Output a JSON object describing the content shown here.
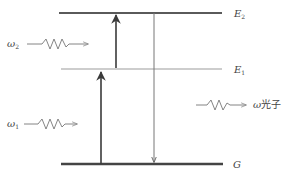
{
  "diagram": {
    "levels": [
      {
        "id": "E2",
        "symbol": "E",
        "subscript": "2",
        "y": 13,
        "x1": 59,
        "x2": 222,
        "color": "#5a5a5a",
        "width": 2
      },
      {
        "id": "E1",
        "symbol": "E",
        "subscript": "1",
        "y": 69,
        "x1": 61,
        "x2": 222,
        "color": "#bcbcbc",
        "width": 1.6
      },
      {
        "id": "G",
        "symbol": "G",
        "subscript": "",
        "y": 164,
        "x1": 61,
        "x2": 223,
        "color": "#444444",
        "width": 2.4
      }
    ],
    "transitions": [
      {
        "from": "G",
        "to": "E1",
        "direction": "up",
        "x": 101
      },
      {
        "from": "E1",
        "to": "E2",
        "direction": "up",
        "x": 116
      },
      {
        "from": "E2",
        "to": "G",
        "direction": "down",
        "x": 154
      }
    ],
    "photons": [
      {
        "id": "omega2",
        "symbol": "ω",
        "subscript": "2",
        "role": "incident"
      },
      {
        "id": "omega1",
        "symbol": "ω",
        "subscript": "1",
        "role": "incident"
      },
      {
        "id": "omega-emitted",
        "symbol": "ω",
        "suffix": "光子",
        "role": "emitted"
      }
    ]
  },
  "labels": {
    "e2_symbol": "E",
    "e2_sub": "2",
    "e1_symbol": "E",
    "e1_sub": "1",
    "g_symbol": "G",
    "omega2_symbol": "ω",
    "omega2_sub": "2",
    "omega1_symbol": "ω",
    "omega1_sub": "1",
    "emitted_symbol": "ω",
    "emitted_text": "光子"
  },
  "colors": {
    "dark_line": "#555555",
    "light_line": "#bcbcbc",
    "ground_line": "#444444",
    "wave": "#777777",
    "text": "#444444"
  }
}
